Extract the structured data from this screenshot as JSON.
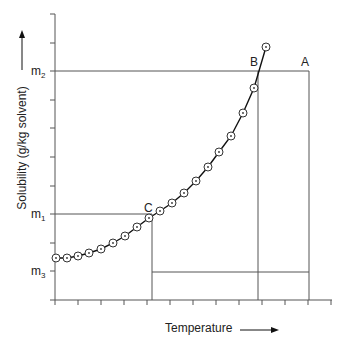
{
  "chart_data": {
    "type": "line",
    "title": "",
    "xlabel": "Temperature",
    "ylabel": "Solubility (g/kg solvent)",
    "y_levels": [
      {
        "name": "m2",
        "label_main": "m",
        "label_sub": "2",
        "y": 71
      },
      {
        "name": "m1",
        "label_main": "m",
        "label_sub": "1",
        "y": 214
      },
      {
        "name": "m3",
        "label_main": "m",
        "label_sub": "3",
        "y": 271
      }
    ],
    "points_labels": [
      {
        "name": "A",
        "text": "A",
        "x": 309,
        "y": 71
      },
      {
        "name": "B",
        "text": "B",
        "x": 258,
        "y": 71
      },
      {
        "name": "C",
        "text": "C",
        "x": 152,
        "y": 214
      }
    ],
    "curve_px": [
      [
        56,
        258
      ],
      [
        67,
        258
      ],
      [
        78,
        256
      ],
      [
        89,
        253
      ],
      [
        101,
        249
      ],
      [
        113,
        243
      ],
      [
        125,
        236
      ],
      [
        137,
        227
      ],
      [
        149,
        218
      ],
      [
        160,
        211
      ],
      [
        172,
        203
      ],
      [
        184,
        193
      ],
      [
        196,
        181
      ],
      [
        208,
        167
      ],
      [
        219,
        152
      ],
      [
        231,
        136
      ],
      [
        243,
        113
      ],
      [
        254,
        88
      ],
      [
        266,
        47
      ]
    ],
    "x_ticks_px": [
      55,
      78,
      101,
      124,
      147,
      170,
      193,
      216,
      239,
      262,
      285,
      308,
      331
    ],
    "y_ticks_px": [
      14,
      43,
      71,
      100,
      128,
      157,
      186,
      214,
      243,
      271,
      300
    ],
    "grid": false,
    "legend": null
  },
  "labels": {
    "xlabel": "Temperature",
    "ylabel": "Solubility (g/kg solvent)",
    "m_main": "m",
    "m2_sub": "2",
    "m1_sub": "1",
    "m3_sub": "3",
    "A": "A",
    "B": "B",
    "C": "C"
  }
}
